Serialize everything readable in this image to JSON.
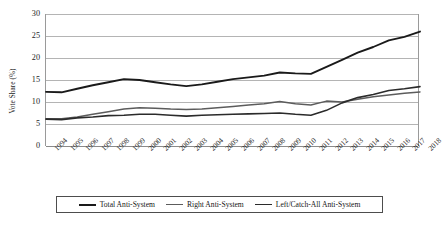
{
  "chart_data": {
    "type": "line",
    "title": "",
    "xlabel": "",
    "ylabel": "Vote Share (%)",
    "ylim": [
      0,
      30
    ],
    "yticks": [
      0,
      5,
      10,
      15,
      20,
      25,
      30
    ],
    "grid": true,
    "legend_position": "bottom",
    "x": [
      1994,
      1995,
      1996,
      1997,
      1998,
      1999,
      2000,
      2001,
      2002,
      2003,
      2004,
      2005,
      2006,
      2007,
      2008,
      2009,
      2010,
      2011,
      2012,
      2013,
      2014,
      2015,
      2016,
      2017,
      2018
    ],
    "categories": [
      "1994",
      "1995",
      "1996",
      "1997",
      "1998",
      "1999",
      "2000",
      "2001",
      "2002",
      "2003",
      "2004",
      "2005",
      "2006",
      "2007",
      "2008",
      "2009",
      "2010",
      "2011",
      "2012",
      "2013",
      "2014",
      "2015",
      "2016",
      "2017",
      "2018"
    ],
    "series": [
      {
        "name": "Total Anti-System",
        "color": "#1a1a1a",
        "width": 1.9,
        "values": [
          12.3,
          12.2,
          13.0,
          13.8,
          14.5,
          15.2,
          15.0,
          14.5,
          14.0,
          13.6,
          14.0,
          14.6,
          15.2,
          15.6,
          16.0,
          16.7,
          16.5,
          16.4,
          18.0,
          19.6,
          21.2,
          22.5,
          24.0,
          24.8,
          26.0
        ]
      },
      {
        "name": "Right Anti-System",
        "color": "#5c5c5c",
        "width": 1.5,
        "values": [
          6.2,
          6.2,
          6.6,
          7.2,
          7.8,
          8.4,
          8.7,
          8.6,
          8.4,
          8.3,
          8.4,
          8.7,
          9.0,
          9.3,
          9.6,
          10.1,
          9.6,
          9.3,
          10.2,
          10.0,
          10.6,
          11.2,
          11.6,
          12.0,
          12.3
        ]
      },
      {
        "name": "Left/Catch-All Anti-System",
        "color": "#2b2b2b",
        "width": 1.6,
        "values": [
          6.1,
          6.0,
          6.4,
          6.6,
          6.9,
          7.0,
          7.2,
          7.2,
          7.0,
          6.8,
          7.0,
          7.1,
          7.2,
          7.3,
          7.4,
          7.5,
          7.2,
          7.0,
          8.1,
          9.8,
          11.0,
          11.7,
          12.6,
          13.0,
          13.5
        ]
      }
    ]
  },
  "legend": {
    "items": [
      {
        "label": "Total Anti-System",
        "color": "#1a1a1a",
        "width": 2.2
      },
      {
        "label": "Right Anti-System",
        "color": "#5c5c5c",
        "width": 1.7
      },
      {
        "label": "Left/Catch-All Anti-System",
        "color": "#2b2b2b",
        "width": 1.9
      }
    ]
  },
  "axis": {
    "y_title": "Vote Share (%)"
  }
}
